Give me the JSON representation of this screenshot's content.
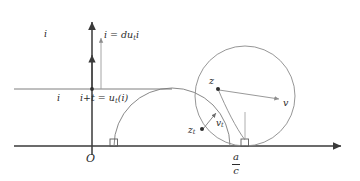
{
  "figure": {
    "background_color": "#ffffff",
    "stroke_dark": "#3a3a3a",
    "stroke_light": "#9a9a9a",
    "text_color": "#2b2b2b",
    "width": 360,
    "height": 181
  },
  "axes": {
    "vertical_axis_label": "i",
    "origin_label": "O",
    "horizontal_axis_name": "real-axis",
    "vertical_axis_name": "imaginary-axis",
    "origin_tick_label": "i"
  },
  "labels": {
    "flow_equation": "i = du",
    "flow_equation_sub": "t",
    "flow_equation_tail": "i",
    "point_equation": "i+t = u",
    "point_equation_sub": "t",
    "point_equation_tail": "(i)",
    "point_z": "z",
    "vector_v": "v",
    "point_zt": "z",
    "point_zt_sub": "t",
    "vector_vt": "v",
    "vector_vt_sub": "t",
    "endpoint_numerator": "a",
    "endpoint_denominator": "c"
  },
  "geometry": {
    "horizontal_line_y": 146,
    "vertical_line_x": 92,
    "horizontal_guide_y": 89,
    "left_semicircle": {
      "cx": 172,
      "cy": 146,
      "r": 58
    },
    "big_circle": {
      "cx": 245,
      "cy": 96,
      "r": 50
    },
    "right_foot_x": 245,
    "right_angle_marks": [
      {
        "x": 114,
        "y": 146
      },
      {
        "x": 245,
        "y": 146
      }
    ],
    "point_z": {
      "x": 218,
      "y": 89
    },
    "point_zt": {
      "x": 202,
      "y": 129
    },
    "vector_v_tip": {
      "x": 280,
      "y": 99
    },
    "vector_vt_tip": {
      "x": 215,
      "y": 113
    }
  }
}
